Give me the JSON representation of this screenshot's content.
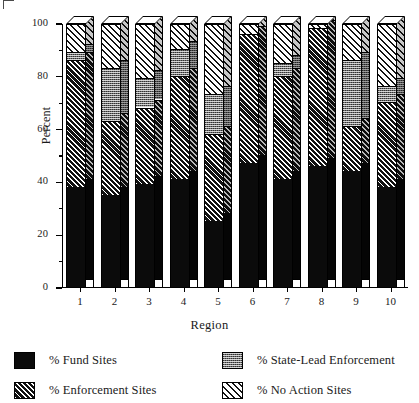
{
  "chart_data": {
    "type": "bar",
    "subtype": "stacked-bar-3d",
    "title": "",
    "xlabel": "Region",
    "ylabel": "Percent",
    "categories": [
      "1",
      "2",
      "3",
      "4",
      "5",
      "6",
      "7",
      "8",
      "9",
      "10"
    ],
    "ylim": [
      0,
      100
    ],
    "yticks": [
      0,
      20,
      40,
      60,
      80,
      100
    ],
    "ytick_labels": [
      "0",
      "20",
      "40",
      "60",
      "80",
      "100"
    ],
    "yminor_ticks": [
      10,
      30,
      50,
      70,
      90
    ],
    "grid": false,
    "legend_position": "below-plot",
    "series": [
      {
        "name": "% Fund Sites",
        "pattern": "solid-black",
        "values": [
          38,
          35,
          39,
          41,
          25,
          47,
          41,
          46,
          44,
          38
        ]
      },
      {
        "name": "% Enforcement Sites",
        "pattern": "diagonal-hatch-dense",
        "values": [
          48,
          28,
          29,
          39,
          33,
          49,
          39,
          52,
          17,
          32
        ]
      },
      {
        "name": "% State-Lead Enforcement",
        "pattern": "stipple-gray",
        "values": [
          3,
          20,
          11,
          10,
          15,
          0,
          5,
          0,
          25,
          6
        ]
      },
      {
        "name": "% No Action Sites",
        "pattern": "diagonal-hatch-open",
        "values": [
          11,
          17,
          21,
          10,
          27,
          4,
          15,
          2,
          14,
          24
        ]
      }
    ],
    "cumulative_tops": {
      "fund": [
        38,
        35,
        39,
        41,
        25,
        47,
        41,
        46,
        44,
        38
      ],
      "enforcement": [
        86,
        63,
        68,
        80,
        58,
        96,
        80,
        98,
        61,
        70
      ],
      "state_lead": [
        89,
        83,
        79,
        90,
        73,
        96,
        85,
        98,
        86,
        76
      ],
      "no_action": [
        100,
        100,
        100,
        100,
        100,
        100,
        100,
        100,
        100,
        100
      ]
    }
  },
  "axes": {
    "y_title": "Percent",
    "x_title": "Region"
  },
  "legend": {
    "items": [
      {
        "label": "% Fund Sites",
        "pattern": "solid-black"
      },
      {
        "label": "% State-Lead Enforcement",
        "pattern": "stipple-gray"
      },
      {
        "label": "% Enforcement Sites",
        "pattern": "diagonal-hatch-dense"
      },
      {
        "label": "% No Action Sites",
        "pattern": "diagonal-hatch-open"
      }
    ]
  },
  "colors": {
    "fund": "#0b0b0b",
    "enforcement": "#111111",
    "state_lead": "#6f6f6f",
    "no_action": "#ffffff",
    "axis": "#000000",
    "background": "#ffffff"
  }
}
